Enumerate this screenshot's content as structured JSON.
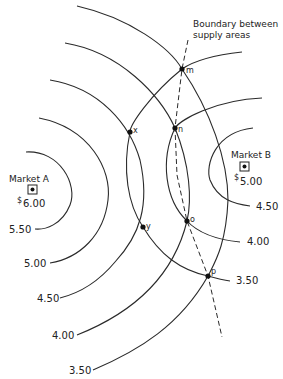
{
  "diagram": {
    "boundary_label_line1": "Boundary between",
    "boundary_label_line2": "supply areas",
    "market_a": {
      "name": "Market A",
      "price_symbol": "$",
      "price": "6.00"
    },
    "market_b": {
      "name": "Market B",
      "price_symbol": "$",
      "price": "5.00"
    },
    "contours_a": [
      "5.50",
      "5.00",
      "4.50",
      "4.00",
      "3.50"
    ],
    "contours_b": [
      "4.50",
      "4.00",
      "3.50"
    ],
    "points": [
      "m",
      "n",
      "x",
      "o",
      "y",
      "p"
    ]
  }
}
